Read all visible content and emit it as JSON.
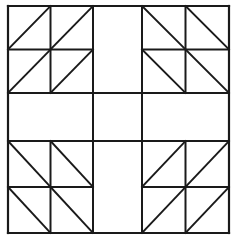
{
  "figure": {
    "type": "line-drawing",
    "canvas": {
      "width": 237,
      "height": 242
    },
    "background_color": "#ffffff",
    "line_color": "#1a1a1a",
    "frame_stroke_width": 2.2,
    "grid_stroke_width": 2.0,
    "diagonal_stroke_width": 1.9
  },
  "geometry": {
    "frame": {
      "x0": 8,
      "y0": 6,
      "x1": 229,
      "y1": 233
    },
    "cross": {
      "vertical_band": {
        "x_left": 93,
        "x_right": 142
      },
      "horizontal_band": {
        "y_top": 93,
        "y_bottom": 141
      },
      "fill": "none",
      "description": "blank plus/cross spanning full width and full height"
    },
    "quadrants": [
      {
        "name": "top-left",
        "x0": 8,
        "y0": 6,
        "x1": 93,
        "y1": 93,
        "rows": 2,
        "cols": 2,
        "diagonal": "/",
        "diagonal_label": "anti-diagonal (bottom-left to top-right)"
      },
      {
        "name": "top-right",
        "x0": 142,
        "y0": 6,
        "x1": 229,
        "y1": 93,
        "rows": 2,
        "cols": 2,
        "diagonal": "\\",
        "diagonal_label": "main diagonal (top-left to bottom-right)"
      },
      {
        "name": "bottom-left",
        "x0": 8,
        "y0": 141,
        "x1": 93,
        "y1": 233,
        "rows": 2,
        "cols": 2,
        "diagonal": "\\",
        "diagonal_label": "main diagonal (top-left to bottom-right)"
      },
      {
        "name": "bottom-right",
        "x0": 142,
        "y0": 141,
        "x1": 229,
        "y1": 233,
        "rows": 2,
        "cols": 2,
        "diagonal": "/",
        "diagonal_label": "anti-diagonal (bottom-left to top-right)"
      }
    ],
    "middle_band_cells": [
      {
        "name": "middle-left-cell",
        "x0": 8,
        "y0": 93,
        "x1": 93,
        "y1": 141
      },
      {
        "name": "center-cell",
        "x0": 93,
        "y0": 93,
        "x1": 142,
        "y1": 141
      },
      {
        "name": "middle-right-cell",
        "x0": 142,
        "y0": 93,
        "x1": 229,
        "y1": 141
      }
    ],
    "center_column_cells": [
      {
        "name": "top-center-cell",
        "x0": 93,
        "y0": 6,
        "x1": 142,
        "y1": 93
      },
      {
        "name": "bottom-center-cell",
        "x0": 93,
        "y0": 141,
        "x1": 142,
        "y1": 233
      }
    ]
  }
}
